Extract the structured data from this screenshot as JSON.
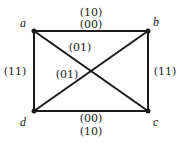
{
  "vertices": {
    "a": {
      "label": "a"
    },
    "b": {
      "label": "b"
    },
    "c": {
      "label": "c"
    },
    "d": {
      "label": "d"
    }
  },
  "edges": {
    "ab": {
      "labels": [
        "(10)",
        "(00)"
      ]
    },
    "dc": {
      "labels": [
        "(00)",
        "(10)"
      ]
    },
    "ad": {
      "labels": [
        "(11)"
      ]
    },
    "bc": {
      "labels": [
        "(11)"
      ]
    },
    "ac": {
      "labels": [
        "(01)"
      ]
    },
    "bd": {
      "labels": [
        "(01)"
      ]
    }
  },
  "colors": {
    "line": "#1a1a1a",
    "text": "#222222",
    "background": "#ffffff"
  }
}
